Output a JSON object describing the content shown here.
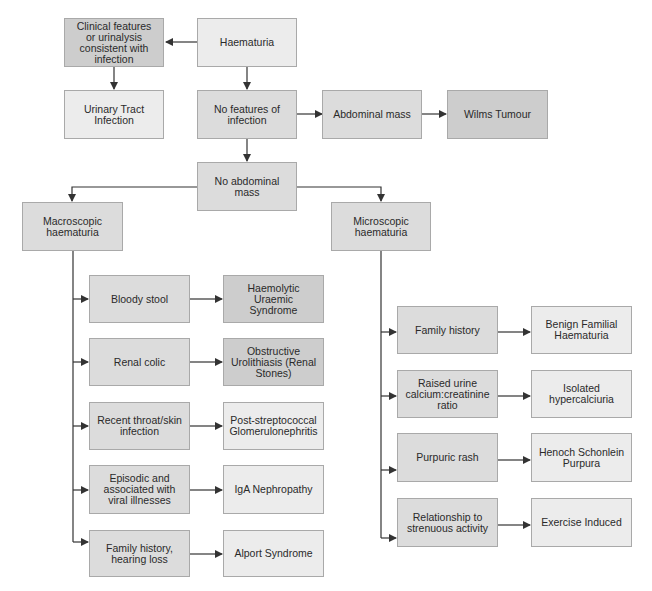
{
  "diagram": {
    "colors": {
      "light": "#ececec",
      "mid": "#dcdcdc",
      "dark": "#cdcdcd",
      "line": "#333333",
      "border": "#a9a9a9"
    },
    "nodes": {
      "haematuria": "Haematuria",
      "clinical_infection": "Clinical features or urinalysis consistent with infection",
      "uti": "Urinary Tract Infection",
      "no_infection": "No features of infection",
      "abdominal_mass": "Abdominal mass",
      "wilms": "Wilms Tumour",
      "no_abdominal_mass": "No abdominal mass",
      "macroscopic": "Macroscopic haematuria",
      "microscopic": "Microscopic haematuria",
      "bloody_stool": "Bloody stool",
      "hus": "Haemolytic Uraemic Syndrome",
      "renal_colic": "Renal colic",
      "urolithiasis": "Obstructive Urolithiasis (Renal Stones)",
      "throat_skin": "Recent throat/skin infection",
      "psgn": "Post-streptococcal Glomerulonephritis",
      "episodic": "Episodic and associated with viral illnesses",
      "iga": "IgA Nephropathy",
      "family_hearing": "Family history, hearing loss",
      "alport": "Alport Syndrome",
      "family_history": "Family history",
      "bfh": "Benign Familial Haematuria",
      "raised_calcium": "Raised urine calcium:creatinine ratio",
      "hypercalciuria": "Isolated hypercalciuria",
      "purpuric_rash": "Purpuric rash",
      "hsp": "Henoch Schonlein Purpura",
      "strenuous": "Relationship to strenuous activity",
      "exercise": "Exercise Induced"
    }
  }
}
